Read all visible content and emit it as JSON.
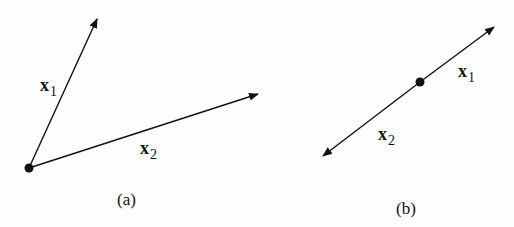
{
  "panels": [
    {
      "caption": "(a)",
      "vectors": [
        {
          "name": "x",
          "sub": "1"
        },
        {
          "name": "x",
          "sub": "2"
        }
      ]
    },
    {
      "caption": "(b)",
      "vectors": [
        {
          "name": "x",
          "sub": "1"
        },
        {
          "name": "x",
          "sub": "2"
        }
      ]
    }
  ],
  "colors": {
    "stroke": "#111111",
    "background": "#fdfdfd"
  }
}
